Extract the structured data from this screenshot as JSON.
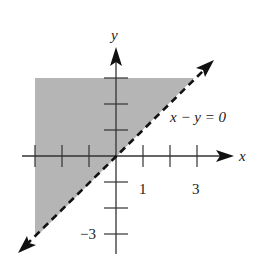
{
  "figure": {
    "type": "inequality-graph",
    "axes": {
      "x_label": "x",
      "y_label": "y",
      "x_ticks": [
        -3,
        -2,
        -1,
        1,
        2,
        3
      ],
      "y_ticks": [
        -3,
        -2,
        -1,
        1,
        2,
        3
      ],
      "x_tick_labels": [
        {
          "value": 1,
          "text": "1"
        },
        {
          "value": 3,
          "text": "3"
        }
      ],
      "y_tick_labels": [
        {
          "value": -3,
          "text": "−3"
        }
      ]
    },
    "boundary_line": {
      "equation": "x − y = 0",
      "label": "x − y = 0",
      "style": "dashed",
      "arrows": "both"
    },
    "shaded_region": {
      "description": "region above line y = x (y > x), within x ≥ -3, y ≤ 3",
      "color": "#b5b5b5"
    },
    "colors": {
      "axis": "#333333",
      "line": "#111111",
      "shade": "#b5b5b5"
    }
  }
}
